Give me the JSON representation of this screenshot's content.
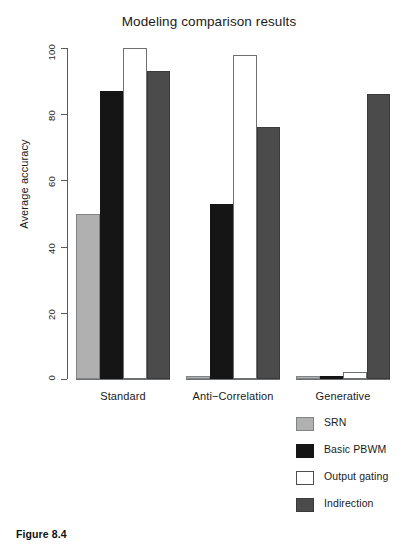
{
  "caption": "Figure 8.4",
  "legend": {
    "position": "bottom-right",
    "entries": [
      {
        "label": "SRN",
        "color": "#b0b0b0",
        "key": "srn"
      },
      {
        "label": "Basic PBWM",
        "color": "#151515",
        "key": "pbwm"
      },
      {
        "label": "Output gating",
        "color": "#ffffff",
        "key": "gating"
      },
      {
        "label": "Indirection",
        "color": "#4b4b4b",
        "key": "indirect"
      }
    ]
  },
  "chart_data": {
    "type": "bar",
    "title": "Modeling comparison results",
    "xlabel": "",
    "ylabel": "Average accuracy",
    "ylim": [
      0,
      100
    ],
    "yticks": [
      0,
      20,
      40,
      60,
      80,
      100
    ],
    "ytick_labels": [
      "0",
      "20",
      "40",
      "60",
      "80",
      "100"
    ],
    "grid": false,
    "categories": [
      "Standard",
      "Anti−Correlation",
      "Generative"
    ],
    "series": [
      {
        "name": "SRN",
        "color": "#b0b0b0",
        "values": [
          50,
          1,
          1
        ]
      },
      {
        "name": "Basic PBWM",
        "color": "#151515",
        "values": [
          87,
          53,
          1
        ]
      },
      {
        "name": "Output gating",
        "color": "#ffffff",
        "values": [
          100,
          98,
          2
        ]
      },
      {
        "name": "Indirection",
        "color": "#4b4b4b",
        "values": [
          93,
          76,
          86
        ]
      }
    ]
  }
}
